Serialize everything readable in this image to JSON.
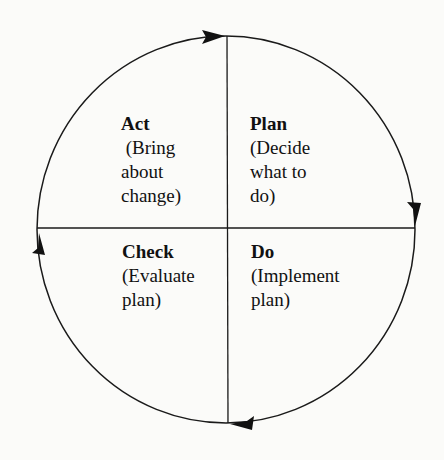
{
  "diagram": {
    "type": "cycle",
    "colors": {
      "background": "#fbfbf9",
      "stroke": "#1a1a1a",
      "text": "#111111"
    },
    "quadrants": [
      {
        "position": "top-left",
        "title": "Act",
        "description": " (Bring\nabout\nchange)"
      },
      {
        "position": "top-right",
        "title": "Plan",
        "description": "(Decide\nwhat to\ndo)"
      },
      {
        "position": "bottom-left",
        "title": "Check",
        "description": "(Evaluate\nplan)"
      },
      {
        "position": "bottom-right",
        "title": "Do",
        "description": "(Implement\nplan)"
      }
    ],
    "arrows": [
      {
        "location": "top",
        "direction": "clockwise"
      },
      {
        "location": "right",
        "direction": "clockwise"
      },
      {
        "location": "bottom",
        "direction": "clockwise"
      },
      {
        "location": "left",
        "direction": "clockwise"
      }
    ]
  }
}
